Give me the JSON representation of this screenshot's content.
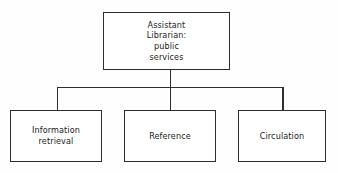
{
  "diagram": {
    "type": "organizational-chart",
    "orientation": "top-down",
    "background_color": "#fefefe",
    "line_color": "#2e2e2e",
    "text_color": "#1a1a1a",
    "root": {
      "label": "Assistant\nLibrarian:\npublic\nservices",
      "lines": [
        "Assistant",
        "Librarian:",
        "public",
        "services"
      ]
    },
    "children": [
      {
        "label": "Information\nretrieval",
        "lines": [
          "Information",
          "retrieval"
        ]
      },
      {
        "label": "Reference",
        "lines": [
          "Reference"
        ]
      },
      {
        "label": "Circulation",
        "lines": [
          "Circulation"
        ]
      }
    ]
  }
}
